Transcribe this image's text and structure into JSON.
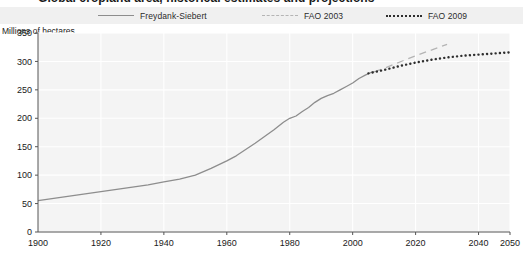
{
  "title": {
    "text": "Global cropland area, historical estimates and projections"
  },
  "legend": {
    "position": "top",
    "items": [
      {
        "label": "Freydank-Siebert",
        "style": "solid",
        "color": "#8d8d8d",
        "icon": "line-solid-icon"
      },
      {
        "label": "FAO 2003",
        "style": "dashed",
        "color": "#b4b4b4",
        "icon": "line-dashed-icon"
      },
      {
        "label": "FAO 2009",
        "style": "dotted",
        "color": "#2e2e2e",
        "icon": "line-dotted-icon"
      }
    ]
  },
  "axis_caption": "Millions of hectares",
  "colors": {
    "plot_background": "#f4f4f4",
    "gridline": "#ffffff",
    "axis": "#555555",
    "text": "#1a1a1a",
    "series_historical": "#8d8d8d",
    "series_fao2003": "#b4b4b4",
    "series_fao2009": "#2e2e2e"
  },
  "chart_data": {
    "type": "line",
    "title": "Global cropland area, historical estimates and projections",
    "subtitle": "",
    "xlabel": "",
    "ylabel": "Millions of hectares",
    "xlim": [
      1900,
      2050
    ],
    "ylim": [
      0,
      350
    ],
    "xticks": [
      1900,
      1920,
      1940,
      1960,
      1980,
      2000,
      2020,
      2040,
      2050
    ],
    "xtick_labels": [
      "1900",
      "1920",
      "1940",
      "1960",
      "1980",
      "2000",
      "2020",
      "2040",
      "2050"
    ],
    "yticks": [
      0,
      50,
      100,
      150,
      200,
      250,
      300,
      350
    ],
    "ytick_labels": [
      "0",
      "50",
      "100",
      "150",
      "200",
      "250",
      "300",
      "350"
    ],
    "grid": true,
    "legend_position": "top",
    "series": [
      {
        "name": "Freydank-Siebert",
        "style": "solid",
        "color": "#8d8d8d",
        "x": [
          1900,
          1905,
          1910,
          1915,
          1920,
          1925,
          1930,
          1935,
          1940,
          1945,
          1950,
          1955,
          1960,
          1963,
          1966,
          1969,
          1972,
          1975,
          1978,
          1980,
          1982,
          1984,
          1986,
          1988,
          1990,
          1992,
          1994,
          1996,
          1998,
          2000,
          2002,
          2004,
          2006,
          2007
        ],
        "values": [
          55,
          59,
          63,
          67,
          71,
          75,
          79,
          83,
          88,
          93,
          100,
          112,
          125,
          134,
          145,
          156,
          168,
          180,
          193,
          200,
          204,
          212,
          219,
          228,
          235,
          240,
          244,
          250,
          256,
          262,
          270,
          276,
          281,
          282
        ]
      },
      {
        "name": "FAO 2003",
        "style": "dashed",
        "color": "#b4b4b4",
        "x": [
          2007,
          2010,
          2015,
          2020,
          2025,
          2030
        ],
        "values": [
          282,
          288,
          299,
          310,
          320,
          330
        ]
      },
      {
        "name": "FAO 2009",
        "style": "dotted",
        "color": "#2e2e2e",
        "x": [
          2005,
          2010,
          2015,
          2020,
          2025,
          2030,
          2035,
          2040,
          2045,
          2050
        ],
        "values": [
          279,
          285,
          292,
          298,
          303,
          307,
          310,
          312,
          314,
          316
        ]
      }
    ]
  }
}
